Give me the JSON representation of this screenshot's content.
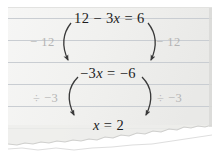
{
  "scene": {
    "kind": "torn-ruled-notebook-paper",
    "paper_color": "#f2f2f0",
    "rule_line_color": "#c9cdd2",
    "ink_color": "#1c1c1c",
    "annotation_color": "#b4b4b4",
    "outer_background": "#ffffff"
  },
  "worked_example": {
    "topic": "solving-a-linear-equation",
    "steps": [
      {
        "id": "step-1",
        "equation": "12 − 3x = 6",
        "parts": {
          "lhs": "12 − 3x",
          "rhs": "6"
        }
      },
      {
        "id": "step-2",
        "equation": "−3x = −6",
        "parts": {
          "lhs": "−3x",
          "rhs": "−6"
        }
      },
      {
        "id": "step-3",
        "equation": "x = 2",
        "parts": {
          "lhs": "x",
          "rhs": "2"
        }
      }
    ],
    "operations": [
      {
        "id": "op-1",
        "label": "− 12",
        "applies_between": [
          "step-1",
          "step-2"
        ],
        "left_label": "− 12",
        "right_label": "− 12"
      },
      {
        "id": "op-2",
        "label": "÷ −3",
        "applies_between": [
          "step-2",
          "step-3"
        ],
        "left_label": "÷ −3",
        "right_label": "÷ −3"
      }
    ],
    "solution": "x = 2"
  }
}
